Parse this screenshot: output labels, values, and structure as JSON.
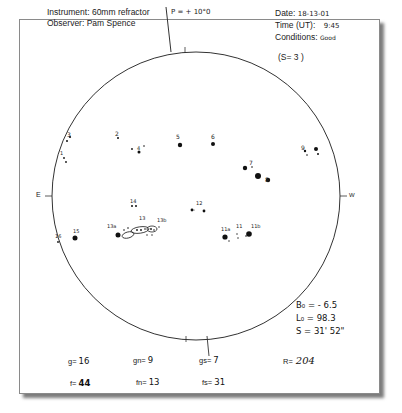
{
  "header": {
    "instrument_label": "Instrument:",
    "instrument_value": "60mm refractor",
    "observer_label": "Observer:",
    "observer_value": "Pam Spence",
    "date_label": "Date:",
    "date_value": "18-13-01",
    "time_label": "Time (UT):",
    "time_value": "9:45",
    "conditions_label": "Conditions:",
    "conditions_value": "Good",
    "seeing": "(S= 3 )"
  },
  "disk": {
    "p_angle": "P = + 10°0",
    "east_label": "E",
    "west_label": "W",
    "spot_groups": [
      {
        "id": "1",
        "label": "1"
      },
      {
        "id": "2",
        "label": "2"
      },
      {
        "id": "3",
        "label": "3"
      },
      {
        "id": "4",
        "label": "4"
      },
      {
        "id": "5",
        "label": "5"
      },
      {
        "id": "6",
        "label": "6"
      },
      {
        "id": "7",
        "label": "7"
      },
      {
        "id": "8",
        "label": "8"
      },
      {
        "id": "9",
        "label": "9"
      },
      {
        "id": "11",
        "label": "11"
      },
      {
        "id": "11a",
        "label": "11a"
      },
      {
        "id": "11b",
        "label": "11b"
      },
      {
        "id": "12",
        "label": "12"
      },
      {
        "id": "13",
        "label": "13"
      },
      {
        "id": "13a",
        "label": "13a"
      },
      {
        "id": "13b",
        "label": "13b"
      },
      {
        "id": "14",
        "label": "14"
      },
      {
        "id": "15",
        "label": "15"
      },
      {
        "id": "16",
        "label": "16"
      }
    ]
  },
  "ephemeris": {
    "b0": "B₀ = - 6.5",
    "l0": "L₀ = 98.3",
    "s": "S = 31' 52\""
  },
  "counts": {
    "g_label": "g=",
    "g_value": "16",
    "gn_label": "gn=",
    "gn_value": "9",
    "gs_label": "gs=",
    "gs_value": "7",
    "r_label": "R=",
    "r_value": "204",
    "f_label": "f=",
    "f_value": "44",
    "fn_label": "fn=",
    "fn_value": "13",
    "fs_label": "fs=",
    "fs_value": "31"
  }
}
